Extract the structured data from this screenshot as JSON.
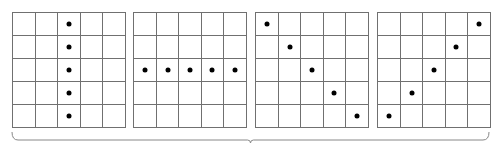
{
  "diagram": {
    "grid_size": 5,
    "line_color": "#707070",
    "dot_color": "#000000",
    "grids": [
      {
        "name": "vertical-column",
        "left": 12,
        "dots": [
          [
            0,
            2
          ],
          [
            1,
            2
          ],
          [
            2,
            2
          ],
          [
            3,
            2
          ],
          [
            4,
            2
          ]
        ]
      },
      {
        "name": "horizontal-row",
        "left": 133,
        "dots": [
          [
            2,
            0
          ],
          [
            2,
            1
          ],
          [
            2,
            2
          ],
          [
            2,
            3
          ],
          [
            2,
            4
          ]
        ]
      },
      {
        "name": "main-diagonal",
        "left": 255,
        "dots": [
          [
            0,
            0
          ],
          [
            1,
            1
          ],
          [
            2,
            2
          ],
          [
            3,
            3
          ],
          [
            4,
            4
          ]
        ]
      },
      {
        "name": "anti-diagonal",
        "left": 377,
        "dots": [
          [
            0,
            4
          ],
          [
            1,
            3
          ],
          [
            2,
            2
          ],
          [
            3,
            1
          ],
          [
            4,
            0
          ]
        ]
      }
    ],
    "brace": {
      "x1": 12,
      "x2": 489,
      "y": 140,
      "orientation": "bottom"
    }
  }
}
